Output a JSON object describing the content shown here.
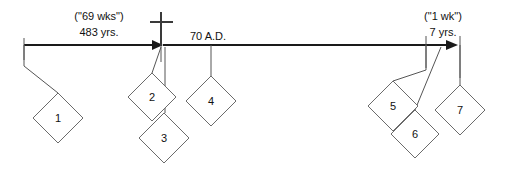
{
  "diagram": {
    "background_color": "#ffffff",
    "line_color": "#1a1a1a",
    "leader_color": "#555555",
    "diamond_stroke_color": "#6b6b6b"
  },
  "labels": {
    "left_span_top": "(\"69 wks\")",
    "left_span_bottom": "483 yrs.",
    "middle": "70 A.D.",
    "right_span_top": "(\"1 wk\")",
    "right_span_bottom": "7 yrs."
  },
  "markers": {
    "cross": "cross-icon"
  },
  "diamonds": [
    {
      "label": "1",
      "cx": 58,
      "cy": 118,
      "r": 25
    },
    {
      "label": "2",
      "cx": 152,
      "cy": 97,
      "r": 24
    },
    {
      "label": "3",
      "cx": 164,
      "cy": 138,
      "r": 25
    },
    {
      "label": "4",
      "cx": 211,
      "cy": 101,
      "r": 25
    },
    {
      "label": "5",
      "cx": 393,
      "cy": 106,
      "r": 25
    },
    {
      "label": "6",
      "cx": 415,
      "cy": 134,
      "r": 24
    },
    {
      "label": "7",
      "cx": 460,
      "cy": 110,
      "r": 25
    }
  ]
}
